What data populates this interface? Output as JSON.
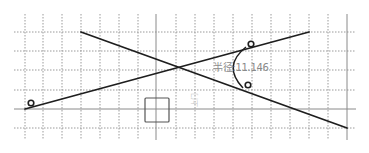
{
  "sketch": {
    "grid": {
      "vertical_x": [
        25,
        43,
        62,
        81,
        100,
        119,
        138,
        176,
        195,
        214,
        233,
        252,
        271,
        290,
        309,
        328
      ],
      "horizontal_y": [
        32,
        51,
        70,
        90,
        128
      ],
      "x_min": 14,
      "x_max": 356,
      "y_min": 14,
      "y_max": 140,
      "color": "#9a9a9a"
    },
    "axes": {
      "vertical_x": 156,
      "right_border_x": 347,
      "horizontal_y": 109,
      "color": "#8a8a8a"
    },
    "lines": [
      {
        "name": "line-a",
        "x1": 81,
        "y1": 32,
        "x2": 347,
        "y2": 128
      },
      {
        "name": "line-b",
        "x1": 25,
        "y1": 109,
        "x2": 309,
        "y2": 32
      }
    ],
    "line_color": "#1e1e1e",
    "tangent_markers": [
      {
        "cx": 31,
        "cy": 103
      },
      {
        "cx": 251,
        "cy": 44
      },
      {
        "cx": 248,
        "cy": 85
      }
    ],
    "fillet_arc": {
      "path": "M 246 47 Q 222 66 243 88"
    },
    "origin_square": {
      "x": 145,
      "y": 98,
      "w": 24,
      "h": 24
    },
    "dimension": {
      "label": "半径:11.146",
      "x": 213,
      "y": 59
    },
    "faint_label": {
      "text": "上门",
      "x": 189,
      "y": 107
    }
  }
}
